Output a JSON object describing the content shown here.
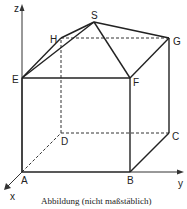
{
  "figure": {
    "caption": "Abbildung (nicht maßstäblich)",
    "axes": {
      "x": "x",
      "y": "y",
      "z": "z"
    },
    "points": {
      "A": "A",
      "B": "B",
      "C": "C",
      "D": "D",
      "E": "E",
      "F": "F",
      "G": "G",
      "H": "H",
      "S": "S"
    },
    "colors": {
      "line": "#222222",
      "background": "#ffffff"
    }
  }
}
